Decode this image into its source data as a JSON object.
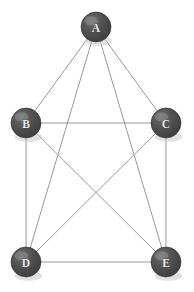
{
  "diagram": {
    "type": "undirected-graph",
    "background_color": "#ffffff",
    "node_fill_color": "#4a4a4a",
    "node_label_color": "#e9e9e9",
    "edge_color": "#8d8d8d",
    "node_radius": 15,
    "nodes": [
      {
        "id": "A",
        "label": "A",
        "x": 96,
        "y": 27
      },
      {
        "id": "B",
        "label": "B",
        "x": 26,
        "y": 123
      },
      {
        "id": "C",
        "label": "C",
        "x": 166,
        "y": 123
      },
      {
        "id": "D",
        "label": "D",
        "x": 26,
        "y": 262
      },
      {
        "id": "E",
        "label": "E",
        "x": 166,
        "y": 262
      }
    ],
    "edges": [
      {
        "from": "A",
        "to": "B"
      },
      {
        "from": "A",
        "to": "C"
      },
      {
        "from": "A",
        "to": "D"
      },
      {
        "from": "A",
        "to": "E"
      },
      {
        "from": "B",
        "to": "C"
      },
      {
        "from": "B",
        "to": "D"
      },
      {
        "from": "B",
        "to": "E"
      },
      {
        "from": "C",
        "to": "D"
      },
      {
        "from": "C",
        "to": "E"
      },
      {
        "from": "D",
        "to": "E"
      }
    ]
  }
}
